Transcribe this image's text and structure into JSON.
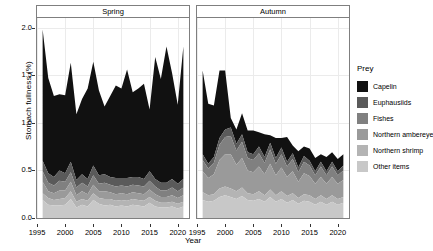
{
  "chart_data": {
    "type": "area",
    "title": "",
    "xlabel": "Year",
    "ylabel": "Stomach fullness (%)",
    "stacked": true,
    "grid": true,
    "legend_position": "right",
    "legend_title": "Prey",
    "xlim": [
      1995,
      2022
    ],
    "ylim": [
      0.0,
      2.1
    ],
    "x_ticks": [
      1995,
      2000,
      2005,
      2010,
      2015,
      2020
    ],
    "y_ticks": [
      "0.0",
      "0.5",
      "1.0",
      "1.5",
      "2.0"
    ],
    "facets": [
      {
        "label": "Spring",
        "x": [
          1996,
          1997,
          1998,
          1999,
          2000,
          2001,
          2002,
          2003,
          2004,
          2005,
          2006,
          2007,
          2008,
          2009,
          2010,
          2011,
          2012,
          2013,
          2014,
          2015,
          2016,
          2017,
          2018,
          2019,
          2020,
          2021
        ],
        "series": [
          {
            "name": "Other items",
            "color": "#c8c8c8",
            "values": [
              0.19,
              0.14,
              0.13,
              0.13,
              0.14,
              0.2,
              0.11,
              0.14,
              0.12,
              0.19,
              0.15,
              0.13,
              0.14,
              0.12,
              0.13,
              0.12,
              0.14,
              0.13,
              0.12,
              0.16,
              0.12,
              0.11,
              0.11,
              0.12,
              0.1,
              0.12
            ]
          },
          {
            "name": "Northern shrimp",
            "color": "#b4b4b4",
            "values": [
              0.07,
              0.07,
              0.06,
              0.07,
              0.07,
              0.08,
              0.06,
              0.06,
              0.06,
              0.07,
              0.06,
              0.07,
              0.06,
              0.06,
              0.06,
              0.06,
              0.06,
              0.06,
              0.06,
              0.06,
              0.06,
              0.05,
              0.05,
              0.05,
              0.05,
              0.05
            ]
          },
          {
            "name": "Northern ambereye",
            "color": "#9a9a9a",
            "values": [
              0.12,
              0.07,
              0.07,
              0.09,
              0.08,
              0.1,
              0.07,
              0.08,
              0.07,
              0.09,
              0.07,
              0.08,
              0.07,
              0.07,
              0.07,
              0.07,
              0.07,
              0.07,
              0.07,
              0.08,
              0.07,
              0.06,
              0.06,
              0.07,
              0.06,
              0.07
            ]
          },
          {
            "name": "Fishes",
            "color": "#808080",
            "values": [
              0.11,
              0.09,
              0.08,
              0.1,
              0.09,
              0.1,
              0.08,
              0.09,
              0.08,
              0.1,
              0.08,
              0.09,
              0.08,
              0.08,
              0.08,
              0.08,
              0.08,
              0.08,
              0.08,
              0.09,
              0.08,
              0.07,
              0.07,
              0.08,
              0.07,
              0.08
            ]
          },
          {
            "name": "Euphausiids",
            "color": "#5a5a5a",
            "values": [
              0.11,
              0.1,
              0.09,
              0.11,
              0.09,
              0.11,
              0.08,
              0.09,
              0.08,
              0.1,
              0.09,
              0.09,
              0.08,
              0.09,
              0.08,
              0.09,
              0.08,
              0.09,
              0.08,
              0.1,
              0.08,
              0.08,
              0.08,
              0.09,
              0.08,
              0.09
            ]
          },
          {
            "name": "Capelin",
            "color": "#111111",
            "values": [
              1.38,
              1.0,
              0.85,
              0.8,
              0.82,
              1.04,
              0.69,
              0.79,
              0.95,
              1.09,
              0.89,
              0.71,
              0.85,
              0.97,
              0.94,
              1.14,
              0.89,
              0.93,
              1.0,
              0.65,
              1.28,
              1.09,
              1.43,
              1.11,
              0.83,
              1.39
            ]
          }
        ]
      },
      {
        "label": "Autumn",
        "x": [
          1996,
          1997,
          1998,
          1999,
          2000,
          2001,
          2002,
          2003,
          2004,
          2005,
          2006,
          2007,
          2008,
          2009,
          2010,
          2011,
          2012,
          2013,
          2014,
          2015,
          2016,
          2017,
          2018,
          2019,
          2020,
          2021
        ],
        "series": [
          {
            "name": "Other items",
            "color": "#c8c8c8",
            "values": [
              0.19,
              0.17,
              0.18,
              0.22,
              0.24,
              0.22,
              0.2,
              0.23,
              0.19,
              0.18,
              0.2,
              0.17,
              0.22,
              0.17,
              0.2,
              0.16,
              0.19,
              0.15,
              0.18,
              0.17,
              0.14,
              0.17,
              0.14,
              0.17,
              0.14,
              0.16
            ]
          },
          {
            "name": "Northern shrimp",
            "color": "#b4b4b4",
            "values": [
              0.08,
              0.07,
              0.07,
              0.09,
              0.09,
              0.09,
              0.08,
              0.09,
              0.07,
              0.07,
              0.08,
              0.07,
              0.08,
              0.07,
              0.08,
              0.07,
              0.07,
              0.06,
              0.07,
              0.07,
              0.06,
              0.07,
              0.06,
              0.07,
              0.06,
              0.06
            ]
          },
          {
            "name": "Northern ambereye",
            "color": "#9a9a9a",
            "values": [
              0.22,
              0.18,
              0.21,
              0.3,
              0.34,
              0.36,
              0.28,
              0.31,
              0.24,
              0.23,
              0.26,
              0.22,
              0.27,
              0.21,
              0.25,
              0.2,
              0.23,
              0.17,
              0.22,
              0.2,
              0.16,
              0.19,
              0.16,
              0.19,
              0.16,
              0.18
            ]
          },
          {
            "name": "Fishes",
            "color": "#808080",
            "values": [
              0.12,
              0.1,
              0.12,
              0.16,
              0.18,
              0.19,
              0.15,
              0.17,
              0.13,
              0.13,
              0.14,
              0.12,
              0.15,
              0.12,
              0.14,
              0.11,
              0.13,
              0.1,
              0.12,
              0.11,
              0.09,
              0.11,
              0.09,
              0.11,
              0.09,
              0.1
            ]
          },
          {
            "name": "Euphausiids",
            "color": "#5a5a5a",
            "values": [
              0.06,
              0.05,
              0.06,
              0.07,
              0.08,
              0.09,
              0.07,
              0.08,
              0.06,
              0.06,
              0.07,
              0.06,
              0.07,
              0.06,
              0.07,
              0.05,
              0.06,
              0.05,
              0.06,
              0.05,
              0.04,
              0.05,
              0.04,
              0.05,
              0.04,
              0.05
            ]
          },
          {
            "name": "Capelin",
            "color": "#111111",
            "values": [
              0.88,
              0.63,
              0.54,
              0.71,
              0.62,
              0.1,
              0.15,
              0.22,
              0.23,
              0.25,
              0.15,
              0.24,
              0.08,
              0.21,
              0.1,
              0.26,
              0.08,
              0.17,
              0.1,
              0.13,
              0.14,
              0.08,
              0.15,
              0.1,
              0.13,
              0.12
            ]
          }
        ]
      }
    ]
  },
  "legend": {
    "title": "Prey",
    "items": [
      {
        "label": "Capelin",
        "color": "#111111"
      },
      {
        "label": "Euphausiids",
        "color": "#5a5a5a"
      },
      {
        "label": "Fishes",
        "color": "#808080"
      },
      {
        "label": "Northern ambereye",
        "color": "#9a9a9a"
      },
      {
        "label": "Northern shrimp",
        "color": "#b4b4b4"
      },
      {
        "label": "Other items",
        "color": "#c8c8c8"
      }
    ]
  }
}
